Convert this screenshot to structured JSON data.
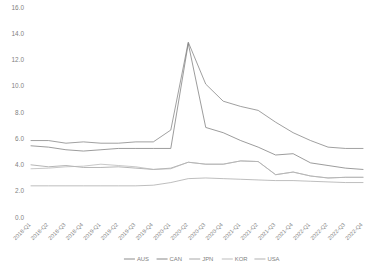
{
  "chart_data": {
    "type": "line",
    "title": "",
    "subtitle": "",
    "xlabel": "",
    "ylabel": "",
    "ylim": [
      0.0,
      16.0
    ],
    "yticks": [
      "0.0",
      "2.0",
      "4.0",
      "6.0",
      "8.0",
      "10.0",
      "12.0",
      "14.0",
      "16.0"
    ],
    "ytick_values": [
      0.0,
      2.0,
      4.0,
      6.0,
      8.0,
      10.0,
      12.0,
      14.0,
      16.0
    ],
    "grid": false,
    "legend_position": "bottom",
    "categories": [
      "2018-Q1",
      "2018-Q2",
      "2018-Q3",
      "2018-Q4",
      "2019-Q1",
      "2019-Q2",
      "2019-Q3",
      "2019-Q4",
      "2020-Q1",
      "2020-Q2",
      "2020-Q3",
      "2020-Q4",
      "2021-Q1",
      "2021-Q2",
      "2021-Q3",
      "2021-Q4",
      "2022-Q1",
      "2022-Q2",
      "2022-Q3",
      "2022-Q4"
    ],
    "series": [
      {
        "name": "AUS",
        "color": "#808080",
        "values": [
          5.9,
          5.9,
          5.7,
          5.8,
          5.7,
          5.7,
          5.8,
          5.8,
          6.7,
          13.4,
          10.2,
          8.9,
          8.5,
          8.2,
          7.3,
          6.5,
          5.9,
          5.4,
          5.3,
          5.3
        ]
      },
      {
        "name": "CAN",
        "color": "#7b7b7b",
        "values": [
          5.5,
          5.4,
          5.2,
          5.1,
          5.2,
          5.3,
          5.3,
          5.3,
          5.3,
          13.3,
          6.9,
          6.5,
          5.9,
          5.4,
          4.8,
          4.9,
          4.2,
          4.0,
          3.8,
          3.7
        ]
      },
      {
        "name": "JPN",
        "color": "#9e9e9e",
        "values": [
          4.05,
          3.9,
          4.0,
          3.85,
          3.85,
          3.9,
          3.8,
          3.7,
          3.8,
          4.25,
          4.1,
          4.1,
          4.35,
          4.3,
          3.3,
          3.5,
          3.2,
          3.05,
          3.1,
          3.1
        ]
      },
      {
        "name": "KOR",
        "color": "#b5b5b5",
        "values": [
          3.75,
          3.8,
          3.9,
          3.95,
          4.1,
          4.0,
          3.9,
          3.7,
          3.75,
          4.25,
          4.1,
          4.1,
          4.35,
          4.3,
          3.3,
          3.5,
          3.2,
          3.05,
          3.1,
          3.1
        ]
      },
      {
        "name": "USA",
        "color": "#a8a8a8",
        "values": [
          2.45,
          2.45,
          2.45,
          2.45,
          2.45,
          2.45,
          2.45,
          2.5,
          2.7,
          3.0,
          3.05,
          3.0,
          2.95,
          2.9,
          2.85,
          2.85,
          2.8,
          2.75,
          2.7,
          2.7
        ]
      }
    ],
    "legend": [
      {
        "label": "AUS",
        "color": "#808080"
      },
      {
        "label": "CAN",
        "color": "#7b7b7b"
      },
      {
        "label": "JPN",
        "color": "#9e9e9e"
      },
      {
        "label": "KOR",
        "color": "#b5b5b5"
      },
      {
        "label": "USA",
        "color": "#a8a8a8"
      }
    ]
  }
}
